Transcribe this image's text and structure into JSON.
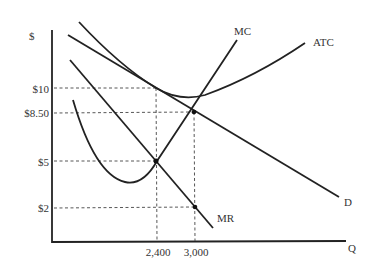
{
  "axes": {
    "y_label": "$",
    "x_label": "Q",
    "y_ticks": [
      {
        "label": "$10",
        "value": 10
      },
      {
        "label": "$8.50",
        "value": 8.5
      },
      {
        "label": "$5",
        "value": 5
      },
      {
        "label": "$2",
        "value": 2
      }
    ],
    "x_ticks": [
      {
        "label": "2,400",
        "value": 2400
      },
      {
        "label": "3,000",
        "value": 3000
      }
    ]
  },
  "curves": {
    "mc": "MC",
    "atc": "ATC",
    "demand": "D",
    "mr": "MR"
  },
  "points": [
    {
      "name": "MR=MC",
      "q": 2400,
      "p": 5
    },
    {
      "name": "ATC tangent to D",
      "q": 2400,
      "p": 10
    },
    {
      "name": "MC=D",
      "q": 3000,
      "p": 8.5
    },
    {
      "name": "MR at 3000",
      "q": 3000,
      "p": 2
    }
  ]
}
